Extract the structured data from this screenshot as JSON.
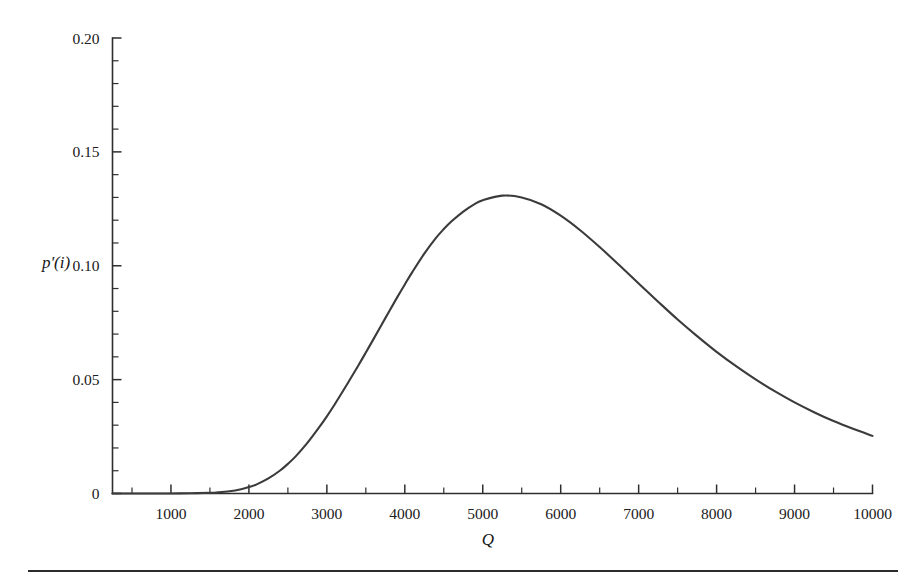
{
  "figure": {
    "name": "probability-density-plot",
    "background_color": "#ffffff",
    "curve_color": "#3b3b3b",
    "axis_color": "#2e2e2e",
    "footer_rule": true
  },
  "chart_data": {
    "type": "line",
    "title": "",
    "subtitle": "",
    "xlabel": "Q",
    "ylabel": "p'(i)",
    "xlim": [
      250,
      10000
    ],
    "ylim": [
      0,
      0.2
    ],
    "grid": false,
    "legend": null,
    "x_ticks_major": [
      1000,
      2000,
      3000,
      4000,
      5000,
      6000,
      7000,
      8000,
      9000,
      10000
    ],
    "x_tick_labels": [
      "1000",
      "2000",
      "3000",
      "4000",
      "5000",
      "6000",
      "7000",
      "8000",
      "9000",
      "10000"
    ],
    "x_tick_minor_step": 500,
    "y_ticks_major": [
      0,
      0.05,
      0.1,
      0.15,
      0.2
    ],
    "y_tick_labels": [
      "0",
      "0.05",
      "0.10",
      "0.15",
      "0.20"
    ],
    "y_tick_minor_step": 0.01,
    "series": [
      {
        "name": "p'(i)",
        "color": "#3b3b3b",
        "x": [
          250,
          500,
          750,
          1000,
          1250,
          1500,
          1600,
          1750,
          1900,
          2000,
          2100,
          2250,
          2400,
          2500,
          2600,
          2750,
          2900,
          3000,
          3100,
          3250,
          3400,
          3500,
          3600,
          3750,
          3900,
          4000,
          4100,
          4250,
          4400,
          4500,
          4600,
          4750,
          4900,
          5000,
          5250,
          5500,
          5750,
          6000,
          6250,
          6500,
          6750,
          7000,
          7250,
          7500,
          7750,
          8000,
          8250,
          8500,
          8750,
          9000,
          9250,
          9500,
          9750,
          10000
        ],
        "y": [
          0.0,
          0.0,
          0.0,
          0.0,
          0.0001,
          0.0003,
          0.0005,
          0.001,
          0.0019,
          0.0028,
          0.004,
          0.0066,
          0.0101,
          0.013,
          0.0163,
          0.0222,
          0.029,
          0.0339,
          0.0391,
          0.0474,
          0.056,
          0.0619,
          0.0679,
          0.077,
          0.086,
          0.0918,
          0.0974,
          0.1053,
          0.1122,
          0.1161,
          0.1195,
          0.1238,
          0.1272,
          0.1288,
          0.1308,
          0.13,
          0.127,
          0.122,
          0.1156,
          0.1082,
          0.1003,
          0.0922,
          0.0842,
          0.0764,
          0.0691,
          0.0622,
          0.0559,
          0.0501,
          0.0448,
          0.04,
          0.0357,
          0.0318,
          0.0284,
          0.0253
        ],
        "peak": {
          "x": 4050,
          "y": 0.131
        }
      }
    ],
    "annotations": []
  }
}
